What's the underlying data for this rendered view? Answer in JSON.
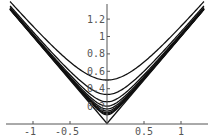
{
  "chart_data": {
    "type": "line",
    "title": "",
    "xlabel": "",
    "ylabel": "",
    "xlim": [
      -1.35,
      1.4
    ],
    "ylim": [
      0,
      1.4
    ],
    "grid": false,
    "legend": null,
    "x_ticks": [
      -1,
      -0.5,
      0.5,
      1
    ],
    "x_tick_labels": [
      "-1",
      "-0.5",
      "0.5",
      "1"
    ],
    "y_ticks": [
      0.2,
      0.4,
      0.6,
      0.8,
      1,
      1.2
    ],
    "y_tick_labels": [
      "0.2",
      "0.4",
      "0.6",
      "0.8",
      "1",
      "1.2"
    ],
    "x_range": [
      -1.31,
      1.31
    ],
    "series": [
      {
        "name": "n=2",
        "min_value": 0.5,
        "formula_c": 0.5
      },
      {
        "name": "n=3",
        "min_value": 0.333,
        "formula_c": 0.3333
      },
      {
        "name": "n=4",
        "min_value": 0.25,
        "formula_c": 0.25
      },
      {
        "name": "n=5",
        "min_value": 0.2,
        "formula_c": 0.2
      },
      {
        "name": "n=6",
        "min_value": 0.167,
        "formula_c": 0.1667
      },
      {
        "name": "n=7",
        "min_value": 0.143,
        "formula_c": 0.1429
      },
      {
        "name": "n=8",
        "min_value": 0.125,
        "formula_c": 0.125
      },
      {
        "name": "n=9",
        "min_value": 0.111,
        "formula_c": 0.1111
      },
      {
        "name": "n=10",
        "min_value": 0.1,
        "formula_c": 0.1
      },
      {
        "name": "limit |x|",
        "min_value": 0,
        "formula_c": 0
      }
    ],
    "colors": {
      "curve": "#111111",
      "axis": "#555555",
      "background": "#ffffff"
    }
  },
  "axes": {
    "x_tick_labels": [
      "-1",
      "-0.5",
      "0.5",
      "1"
    ],
    "y_tick_labels": [
      "0.2",
      "0.4",
      "0.6",
      "0.8",
      "1",
      "1.2"
    ]
  }
}
